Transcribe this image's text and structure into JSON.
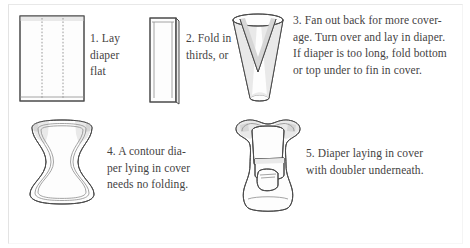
{
  "diagram": {
    "steps": [
      {
        "number": "1",
        "figure_name": "flat-diaper-rectangle",
        "caption": "1. Lay\ndiaper\nflat"
      },
      {
        "number": "2",
        "figure_name": "diaper-folded-in-thirds",
        "caption": "2. Fold in\nthirds, or"
      },
      {
        "number": "3",
        "figure_name": "diaper-fanned-out-back",
        "caption": "3. Fan out back for more cover-\nage. Turn over and lay in diaper.\nIf diaper is too long, fold bottom\nor top under to fin in cover."
      },
      {
        "number": "4",
        "figure_name": "contour-diaper-in-cover",
        "caption": "4. A contour dia-\nper lying in cover\nneeds no folding."
      },
      {
        "number": "5",
        "figure_name": "diaper-in-cover-with-doubler",
        "caption": "5. Diaper laying in cover\nwith doubler underneath."
      }
    ]
  },
  "colors": {
    "background": "#ffffff",
    "ink": "#4a4a4a",
    "text": "#44423f",
    "shading": "#e9e9e9",
    "fold_line": "#9a9a9a"
  }
}
